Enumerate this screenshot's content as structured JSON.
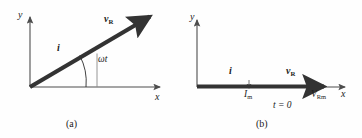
{
  "figure": {
    "type": "phasor-diagram",
    "background_color": "#fefefe",
    "ink_color": "#1b1b1b",
    "axis_color": "#4d4d4d",
    "phasor_color": "#333333"
  },
  "panels": [
    {
      "id": "a",
      "caption": "(a)",
      "axes": {
        "x_label": "x",
        "y_label": "y"
      },
      "phasor": {
        "voltage_label": "v",
        "voltage_sub": "R",
        "current_label": "i",
        "angle_label": "ωt",
        "angle_degrees": 27
      }
    },
    {
      "id": "b",
      "caption": "(b)",
      "axes": {
        "x_label": "x",
        "y_label": "y"
      },
      "phasor": {
        "voltage_label": "v",
        "voltage_sub": "R",
        "current_label": "i",
        "current_amplitude_label": "I",
        "current_amplitude_sub": "m",
        "voltage_amplitude_label": "V",
        "voltage_amplitude_sub": "Rm",
        "time_label": "t = 0",
        "angle_degrees": 0
      }
    }
  ]
}
